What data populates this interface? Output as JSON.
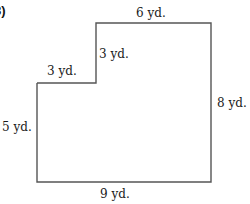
{
  "problem": {
    "number": "8)"
  },
  "figure": {
    "shape": "L-shaped polygon (rectangle with top-left notch)",
    "stroke_color": "#555555",
    "labels": {
      "top": "6 yd.",
      "notch_vertical": "3 yd.",
      "notch_horizontal": "3 yd.",
      "left": "5 yd.",
      "right": "8 yd.",
      "bottom": "9 yd."
    }
  }
}
